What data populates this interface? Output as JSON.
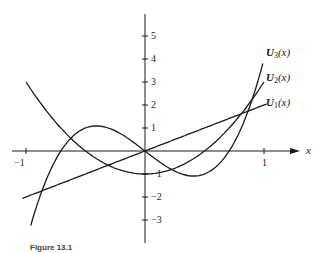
{
  "chart_data": {
    "type": "line",
    "title": "",
    "xlabel": "x",
    "ylabel": "",
    "xlim": [
      -1.05,
      1.2
    ],
    "ylim": [
      -4,
      6
    ],
    "x_ticks": [
      "-1",
      "1"
    ],
    "y_ticks": [
      "5",
      "4",
      "3",
      "2",
      "1",
      "-1",
      "-2",
      "-3"
    ],
    "grid": false,
    "series": [
      {
        "name": "U_1(x)",
        "formula": "2x",
        "x": [
          -1,
          0,
          1
        ],
        "values": [
          -2,
          0,
          2
        ]
      },
      {
        "name": "U_2(x)",
        "formula": "4x^2 - 1",
        "x": [
          -1,
          -0.5,
          0,
          0.5,
          1
        ],
        "values": [
          3,
          0,
          -1,
          0,
          3
        ]
      },
      {
        "name": "U_3(x)",
        "formula": "8x^3 - 4x",
        "x": [
          -0.95,
          -0.707,
          -0.408,
          0,
          0.408,
          0.707,
          0.98
        ],
        "values": [
          -3.06,
          0,
          1.09,
          0,
          -1.09,
          0,
          3.61
        ]
      }
    ]
  },
  "labels": {
    "x_axis": "x",
    "u1": "U",
    "u1_sub": "1",
    "u2": "U",
    "u2_sub": "2",
    "u3": "U",
    "u3_sub": "3",
    "arg": "(x)",
    "tick_neg1": "−1",
    "tick_pos1": "1",
    "y5": "5",
    "y4": "4",
    "y3": "3",
    "y2": "2",
    "y1": "1",
    "ym1": "−1",
    "ym2": "−2",
    "ym3": "−3"
  },
  "caption": "Figure 13.1"
}
